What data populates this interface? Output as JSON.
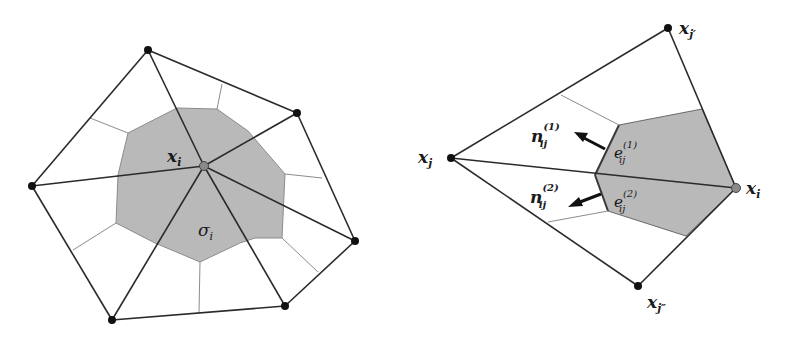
{
  "colors": {
    "background": "#ffffff",
    "cell_fill": "#b9b9b9",
    "edge": "#2a2a2a",
    "dual_edge": "#8c8c8c",
    "node": "#111111",
    "center_node": "#8a8a8a"
  },
  "left_panel": {
    "center_label": {
      "base": "x",
      "sub": "i"
    },
    "cell_label": {
      "base": "σ",
      "sub": "i"
    },
    "center": [
      204,
      166
    ],
    "neighbors": [
      [
        148,
        50
      ],
      [
        297,
        113
      ],
      [
        355,
        241
      ],
      [
        285,
        306
      ],
      [
        112,
        320
      ],
      [
        32,
        186
      ]
    ],
    "cell_polygon": [
      [
        128,
        133
      ],
      [
        177,
        108
      ],
      [
        217,
        109
      ],
      [
        248,
        131
      ],
      [
        285,
        174
      ],
      [
        282,
        238
      ],
      [
        255,
        238
      ],
      [
        240,
        243
      ],
      [
        200,
        262
      ],
      [
        155,
        243
      ],
      [
        116,
        223
      ],
      [
        118,
        175
      ]
    ],
    "dual_segments": [
      [
        [
          128,
          133
        ],
        [
          90,
          118
        ]
      ],
      [
        [
          217,
          109
        ],
        [
          222,
          84
        ]
      ],
      [
        [
          285,
          174
        ],
        [
          322,
          178
        ]
      ],
      [
        [
          282,
          238
        ],
        [
          318,
          272
        ]
      ],
      [
        [
          200,
          262
        ],
        [
          199,
          313
        ]
      ],
      [
        [
          116,
          223
        ],
        [
          73,
          250
        ]
      ]
    ]
  },
  "right_panel": {
    "labels": {
      "xj": {
        "base": "x",
        "sub": "j"
      },
      "xjp": {
        "base": "x",
        "sub": "j′"
      },
      "xjpp": {
        "base": "x",
        "sub": "j″"
      },
      "xi": {
        "base": "x",
        "sub": "i"
      },
      "n1": {
        "base": "n",
        "sub": "ij",
        "sup": "(1)"
      },
      "n2": {
        "base": "n",
        "sub": "ij",
        "sup": "(2)"
      },
      "e1": {
        "base": "e",
        "sub": "ij",
        "sup": "(1)"
      },
      "e2": {
        "base": "e",
        "sub": "ij",
        "sup": "(2)"
      }
    },
    "nodes": {
      "xj": [
        451,
        158
      ],
      "xjp": [
        668,
        28
      ],
      "xjpp": [
        638,
        286
      ],
      "xi": [
        736,
        188
      ]
    },
    "cell_polygon": [
      [
        619,
        125
      ],
      [
        702,
        109
      ],
      [
        736,
        188
      ],
      [
        686,
        236
      ],
      [
        608,
        211
      ],
      [
        595,
        175
      ]
    ],
    "dual_segments": [
      [
        [
          561,
          95
        ],
        [
          619,
          125
        ]
      ],
      [
        [
          548,
          222
        ],
        [
          608,
          211
        ]
      ]
    ]
  }
}
